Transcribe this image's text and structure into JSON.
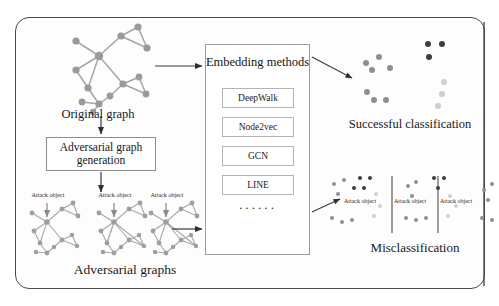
{
  "nodes": {
    "original_graph_label": "Original graph",
    "adversarial_generation_label": "Adversarial graph generation",
    "adversarial_graphs_label": "Adversarial graphs",
    "successful_label": "Successful classification",
    "misclassification_label": "Misclassification",
    "attack_object_label": "Attack object"
  },
  "embedding": {
    "title": "Embedding methods",
    "methods": [
      "DeepWalk",
      "Node2vec",
      "GCN",
      "LINE"
    ],
    "ellipsis": "······"
  },
  "attack_labels_adversarial": [
    "Attack object",
    "Attack object",
    "Attack object"
  ],
  "attack_labels_misclassification": [
    "Attack object",
    "Attack object",
    "Attack object"
  ],
  "colors": {
    "frame": "#4a4a4a",
    "node_gray": "#9a9a9a",
    "edge_gray": "#a6a6a6",
    "cluster_medium": "#8f8f8f",
    "cluster_dark": "#3d3d3d",
    "cluster_light": "#cfcfcf",
    "arrow": "#333333",
    "box_border": "#9a9a9a",
    "text": "#1a1a1a"
  },
  "chart_data": {
    "type": "scatter",
    "panels": [
      {
        "name": "successful-classification",
        "label": "Successful classification",
        "clusters": [
          {
            "name": "cluster-medium",
            "color": "#8f8f8f",
            "points": [
              [
                27,
                27
              ],
              [
                14,
                33
              ],
              [
                20,
                40
              ],
              [
                38,
                38
              ],
              [
                15,
                62
              ],
              [
                22,
                70
              ],
              [
                34,
                70
              ]
            ]
          },
          {
            "name": "cluster-dark",
            "color": "#3d3d3d",
            "points": [
              [
                76,
                14
              ],
              [
                90,
                14
              ],
              [
                77,
                27
              ]
            ]
          },
          {
            "name": "cluster-light",
            "color": "#cfcfcf",
            "points": [
              [
                92,
                52
              ],
              [
                90,
                64
              ],
              [
                86,
                76
              ]
            ]
          }
        ]
      },
      {
        "name": "misclassification",
        "label": "Misclassification",
        "groups": [
          {
            "name": "group-1",
            "divider_x": 62,
            "attack_label": "Attack object",
            "clusters": [
              {
                "name": "cluster-dark",
                "color": "#3d3d3d",
                "points": [
                  [
                    30,
                    6
                  ],
                  [
                    40,
                    6
                  ],
                  [
                    24,
                    16
                  ],
                  [
                    34,
                    16
                  ]
                ]
              },
              {
                "name": "cluster-medium",
                "color": "#8f8f8f",
                "points": [
                  [
                    4,
                    12
                  ],
                  [
                    14,
                    8
                  ],
                  [
                    8,
                    22
                  ],
                  [
                    2,
                    46
                  ],
                  [
                    12,
                    50
                  ],
                  [
                    22,
                    48
                  ]
                ]
              },
              {
                "name": "cluster-light",
                "color": "#cfcfcf",
                "points": [
                  [
                    46,
                    22
                  ],
                  [
                    50,
                    34
                  ],
                  [
                    44,
                    44
                  ]
                ]
              }
            ]
          },
          {
            "name": "group-2",
            "divider_x": 146,
            "attack_label": "Attack object",
            "clusters": [
              {
                "name": "cluster-dark",
                "color": "#3d3d3d",
                "points": [
                  [
                    104,
                    6
                  ],
                  [
                    114,
                    6
                  ],
                  [
                    108,
                    16
                  ]
                ]
              },
              {
                "name": "cluster-medium",
                "color": "#8f8f8f",
                "points": [
                  [
                    78,
                    14
                  ],
                  [
                    86,
                    10
                  ],
                  [
                    82,
                    24
                  ],
                  [
                    76,
                    46
                  ],
                  [
                    86,
                    48
                  ],
                  [
                    96,
                    46
                  ]
                ]
              },
              {
                "name": "cluster-light",
                "color": "#cfcfcf",
                "points": [
                  [
                    120,
                    24
                  ],
                  [
                    126,
                    34
                  ],
                  [
                    118,
                    44
                  ]
                ]
              }
            ]
          },
          {
            "name": "group-3",
            "attack_label": "Attack object",
            "clusters": [
              {
                "name": "cluster-dark",
                "color": "#3d3d3d",
                "points": [
                  [
                    176,
                    6
                  ],
                  [
                    186,
                    6
                  ],
                  [
                    180,
                    16
                  ]
                ]
              },
              {
                "name": "cluster-medium",
                "color": "#8f8f8f",
                "points": [
                  [
                    154,
                    18
                  ],
                  [
                    162,
                    12
                  ],
                  [
                    158,
                    28
                  ],
                  [
                    152,
                    46
                  ],
                  [
                    162,
                    48
                  ],
                  [
                    172,
                    46
                  ]
                ]
              },
              {
                "name": "cluster-light",
                "color": "#cfcfcf",
                "points": [
                  [
                    192,
                    26
                  ],
                  [
                    196,
                    36
                  ],
                  [
                    188,
                    46
                  ]
                ]
              }
            ]
          }
        ]
      }
    ]
  }
}
